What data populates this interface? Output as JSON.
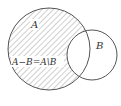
{
  "diagram": {
    "type": "venn",
    "sets": [
      {
        "id": "A",
        "label": "A",
        "cx": 49,
        "cy": 49,
        "r": 41
      },
      {
        "id": "B",
        "label": "B",
        "cx": 92,
        "cy": 55,
        "r": 25
      }
    ],
    "shaded_region": "A minus B",
    "region_label": "A−B=A\\B",
    "colors": {
      "stroke": "#555555",
      "hatch": "#777777",
      "background": "#ffffff"
    }
  }
}
